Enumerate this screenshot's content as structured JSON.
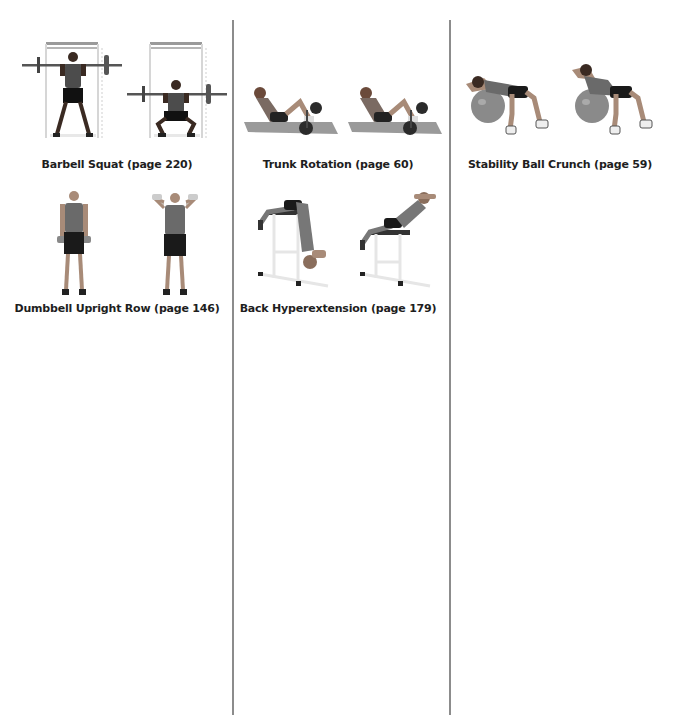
{
  "page": {
    "background": "#ffffff",
    "divider_color": "#8c8c8c"
  },
  "columns": [
    {
      "exercises": [
        {
          "caption": "Barbell Squat (page 220)",
          "images": [
            {
              "alt": "barbell-squat-start-standing"
            },
            {
              "alt": "barbell-squat-bottom-position"
            }
          ]
        },
        {
          "caption": "Dumbbell Upright Row (page 146)",
          "images": [
            {
              "alt": "dumbbell-upright-row-start"
            },
            {
              "alt": "dumbbell-upright-row-top"
            }
          ]
        }
      ]
    },
    {
      "exercises": [
        {
          "caption": "Trunk Rotation (page 60)",
          "images": [
            {
              "alt": "trunk-rotation-center"
            },
            {
              "alt": "trunk-rotation-twist"
            }
          ]
        },
        {
          "caption": "Back Hyperextension (page 179)",
          "images": [
            {
              "alt": "back-hyperextension-down"
            },
            {
              "alt": "back-hyperextension-up"
            }
          ]
        }
      ]
    },
    {
      "exercises": [
        {
          "caption": "Stability Ball Crunch (page 59)",
          "images": [
            {
              "alt": "stability-ball-crunch-down"
            },
            {
              "alt": "stability-ball-crunch-up"
            }
          ]
        }
      ]
    }
  ]
}
